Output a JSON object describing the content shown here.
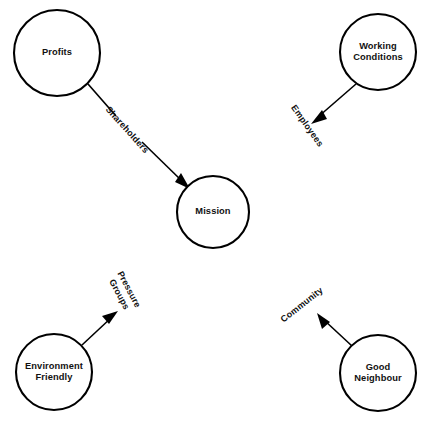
{
  "diagram": {
    "canvas": {
      "width": 429,
      "height": 429,
      "background": "#ffffff"
    },
    "stroke_color": "#000000",
    "text_color": "#111111",
    "nodes": [
      {
        "id": "profits",
        "label": "Profits",
        "cx": 57,
        "cy": 53,
        "r": 43
      },
      {
        "id": "working",
        "label": "Working\nConditions",
        "cx": 378,
        "cy": 52,
        "r": 38
      },
      {
        "id": "mission",
        "label": "Mission",
        "cx": 213,
        "cy": 212,
        "r": 36
      },
      {
        "id": "environment",
        "label": "Environment\nFriendly",
        "cx": 54,
        "cy": 372,
        "r": 38
      },
      {
        "id": "neighbour",
        "label": "Good\nNeighbour",
        "cx": 378,
        "cy": 373,
        "r": 38
      }
    ],
    "edges": [
      {
        "id": "profits-mission",
        "from": "profits",
        "to": "mission",
        "label": "Shareholders",
        "label_x": 127,
        "label_y": 130,
        "label_rotation": 48,
        "arrow": true
      },
      {
        "id": "working-employees",
        "from": "working",
        "to": "employees",
        "label": "Employees",
        "label_x": 307,
        "label_y": 126,
        "label_rotation": 55,
        "arrow": true
      },
      {
        "id": "environment-pressure",
        "from": "environment",
        "to": "pressure-groups",
        "label": "Pressure\nGroups",
        "label_x": 124,
        "label_y": 292,
        "label_rotation": 62,
        "arrow": true
      },
      {
        "id": "neighbour-community",
        "from": "neighbour",
        "to": "community",
        "label": "Community",
        "label_x": 302,
        "label_y": 305,
        "label_rotation": -38,
        "arrow": true
      }
    ]
  }
}
